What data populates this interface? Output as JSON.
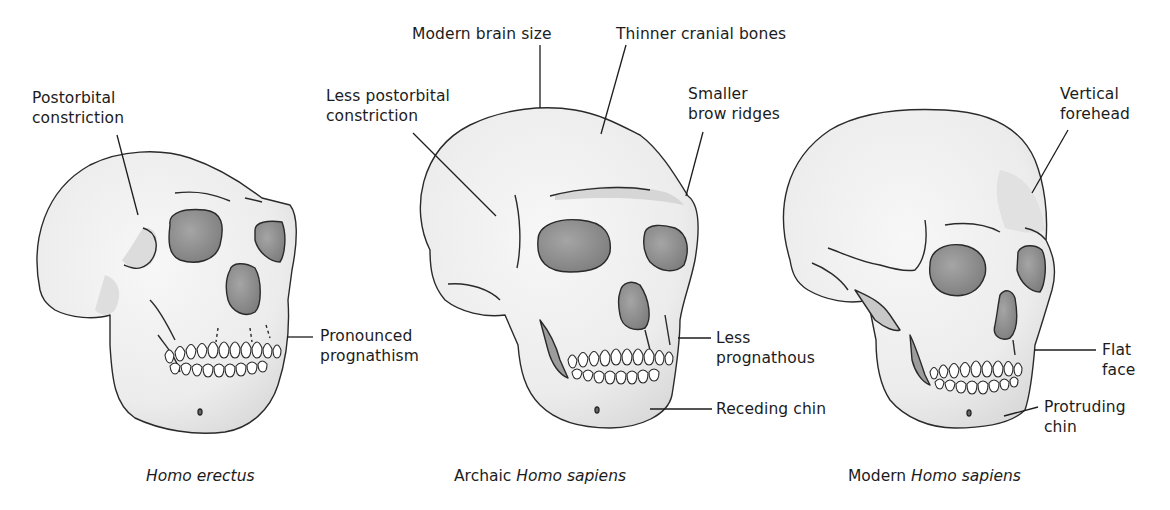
{
  "figure": {
    "skulls": [
      {
        "id": "homo-erectus",
        "caption_plain": "",
        "caption_italic": "Homo erectus",
        "labels": [
          {
            "id": "postorbital-constriction",
            "text": "Postorbital\nconstriction"
          },
          {
            "id": "pronounced-prognathism",
            "text": "Pronounced\nprognathism"
          }
        ]
      },
      {
        "id": "archaic-homo-sapiens",
        "caption_plain": "Archaic ",
        "caption_italic": "Homo sapiens",
        "labels": [
          {
            "id": "modern-brain-size",
            "text": "Modern brain size"
          },
          {
            "id": "thinner-cranial-bones",
            "text": "Thinner cranial bones"
          },
          {
            "id": "less-postorbital-constriction",
            "text": "Less postorbital\nconstriction"
          },
          {
            "id": "smaller-brow-ridges",
            "text": "Smaller\nbrow ridges"
          },
          {
            "id": "less-prognathous",
            "text": "Less\nprognathous"
          },
          {
            "id": "receding-chin",
            "text": "Receding chin"
          }
        ]
      },
      {
        "id": "modern-homo-sapiens",
        "caption_plain": "Modern ",
        "caption_italic": "Homo sapiens",
        "labels": [
          {
            "id": "vertical-forehead",
            "text": "Vertical\nforehead"
          },
          {
            "id": "flat-face",
            "text": "Flat\nface"
          },
          {
            "id": "protruding-chin",
            "text": "Protruding\nchin"
          }
        ]
      }
    ],
    "colors": {
      "bone": "#f1f1f1",
      "bone_shade": "#d9d9d9",
      "socket": "#8c8c8c",
      "outline": "#2a2a2a",
      "text": "#1c1c1c"
    }
  }
}
